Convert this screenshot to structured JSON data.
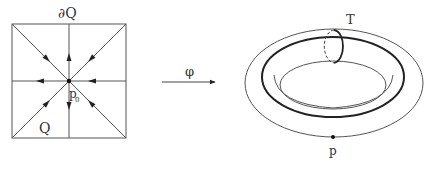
{
  "diagram": {
    "left": {
      "boundary_label": "∂Q",
      "region_label": "Q",
      "center_label": "p₀",
      "center_label_main": "p",
      "center_label_sub": "0",
      "arrow_count": 8,
      "arrow_direction": "toward center"
    },
    "map": {
      "label": "φ"
    },
    "right": {
      "torus_label": "T",
      "point_label": "p"
    },
    "colors": {
      "line": "#555555",
      "thick_line": "#222222",
      "background": "#ffffff"
    }
  }
}
